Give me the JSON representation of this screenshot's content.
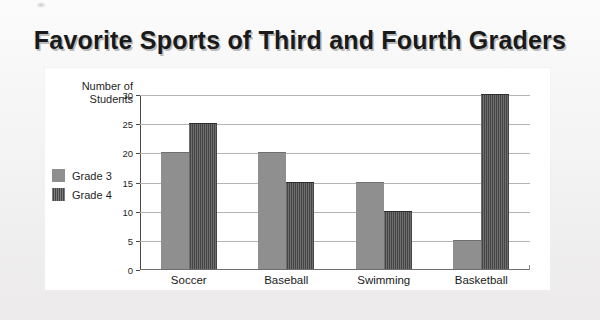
{
  "chart_data": {
    "type": "bar",
    "title": "Favorite Sports of Third and Fourth Graders",
    "xlabel": "",
    "ylabel": "Number of Students",
    "categories": [
      "Soccer",
      "Baseball",
      "Swimming",
      "Basketball"
    ],
    "series": [
      {
        "name": "Grade 3",
        "color": "#8f8f8f",
        "values": [
          20,
          20,
          15,
          5
        ]
      },
      {
        "name": "Grade 4",
        "color": "#454545",
        "values": [
          25,
          15,
          10,
          30
        ]
      }
    ],
    "ylim": [
      0,
      30
    ],
    "ytick_step": 5,
    "yticks": [
      0,
      5,
      10,
      15,
      20,
      25,
      30
    ],
    "grid": true,
    "legend_position": "left"
  },
  "axis": {
    "y_title_line1": "Number of",
    "y_title_line2": "Students"
  }
}
